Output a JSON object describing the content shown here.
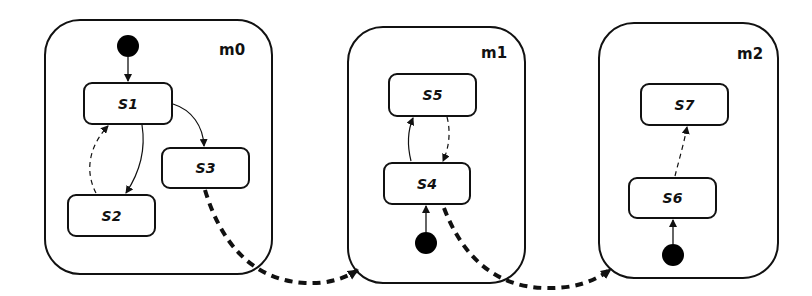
{
  "diagram": {
    "modules": [
      {
        "id": "m0",
        "label": "m0"
      },
      {
        "id": "m1",
        "label": "m1"
      },
      {
        "id": "m2",
        "label": "m2"
      }
    ],
    "states": [
      {
        "id": "S1",
        "label": "S1",
        "module": "m0"
      },
      {
        "id": "S2",
        "label": "S2",
        "module": "m0"
      },
      {
        "id": "S3",
        "label": "S3",
        "module": "m0"
      },
      {
        "id": "S4",
        "label": "S4",
        "module": "m1"
      },
      {
        "id": "S5",
        "label": "S5",
        "module": "m1"
      },
      {
        "id": "S6",
        "label": "S6",
        "module": "m2"
      },
      {
        "id": "S7",
        "label": "S7",
        "module": "m2"
      }
    ],
    "initial_states": [
      {
        "module": "m0",
        "target": "S1"
      },
      {
        "module": "m1",
        "target": "S4"
      },
      {
        "module": "m2",
        "target": "S6"
      }
    ],
    "transitions": [
      {
        "from": "S1",
        "to": "S2",
        "style": "solid"
      },
      {
        "from": "S2",
        "to": "S1",
        "style": "dashed"
      },
      {
        "from": "S1",
        "to": "S3",
        "style": "solid"
      },
      {
        "from": "S4",
        "to": "S5",
        "style": "solid"
      },
      {
        "from": "S5",
        "to": "S4",
        "style": "dashed"
      },
      {
        "from": "S6",
        "to": "S7",
        "style": "dashed"
      },
      {
        "from": "S3",
        "to": "m1",
        "style": "thick-dashed"
      },
      {
        "from": "S4",
        "to": "m2",
        "style": "thick-dashed"
      }
    ],
    "colors": {
      "stroke": "#111111",
      "fill": "#ffffff",
      "initial": "#000000"
    }
  }
}
